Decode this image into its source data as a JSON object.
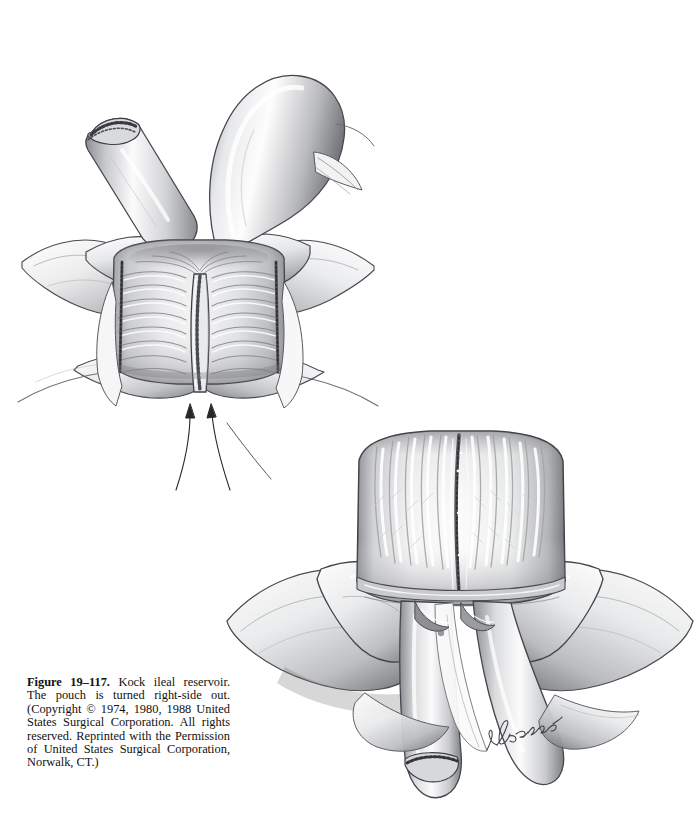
{
  "page": {
    "background_color": "#ffffff",
    "figure_number": "19-117",
    "ink_color": "#2b2b2b"
  },
  "caption": {
    "label": "Figure 19–117.",
    "text": " Kock ileal reservoir. The pouch is turned right-side out. (Copyright © 1974, 1980, 1988 United States Surgical Corporation. All rights reserved. Reprinted with the Permission of United States Surgical Corporation, Norwalk, CT.)",
    "full_text": "Figure 19–117. Kock ileal reservoir. The pouch is turned right-side out. (Copyright © 1974, 1980, 1988 United States Surgical Corporation. All rights reserved. Reprinted with the Permission of United States Surgical Corporation, Norwalk, CT.)",
    "lines": [
      "Figure 19–117. Kock ileal reservoir.",
      "The pouch is turned right-side out.",
      "(Copyright © 1974, 1980, 1988 United",
      "States Surgical Corporation. All rights",
      "reserved. Reprinted with the Permis-",
      "sion of United States Surgical Corpo-",
      "ration, Norwalk, CT.)"
    ]
  },
  "illustrations": [
    {
      "id": "top",
      "name": "kock-pouch-serosal-view",
      "description": "Two hands holding the closed Kock ileal reservoir pouch, serosal surface outward, with stapled efferent limb stump at upper left and afferent ileal loop at upper right. Two arrows below point to the nipple valve.",
      "annotations": [
        "arrow-left",
        "arrow-right"
      ]
    },
    {
      "id": "bottom",
      "name": "kock-pouch-mucosal-view",
      "description": "Two hands holding the pouch turned right-side out, exposing the mucosal surface with vertical villous folds and a central suture line; two ileal limbs descend below, the left limb with a stapled end.",
      "annotations": []
    }
  ],
  "signature": {
    "artist": "N. Baker"
  }
}
